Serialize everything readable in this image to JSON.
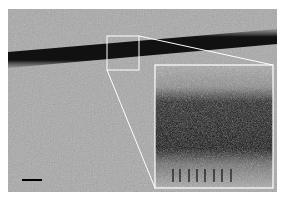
{
  "figure": {
    "background_color": "#a8a8a8",
    "filament_color": "#141414",
    "annotation_color": "#ffffff",
    "selection_box": {
      "x": 107,
      "y": 36,
      "w": 32,
      "h": 34
    },
    "inset": {
      "x": 155,
      "y": 65,
      "w": 118,
      "h": 123
    },
    "inset_marker_count": 8,
    "scale_bar": {
      "x": 22,
      "y": 180,
      "w": 20,
      "color": "#000000"
    }
  }
}
